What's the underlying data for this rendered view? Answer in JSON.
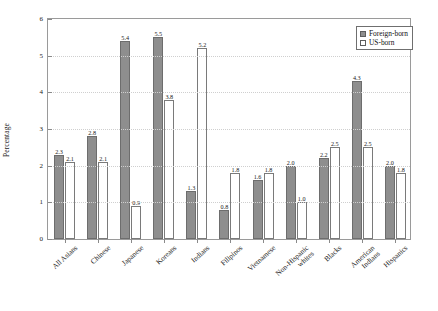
{
  "chart_data": {
    "type": "bar",
    "title": "",
    "xlabel": "",
    "ylabel": "Percentage",
    "ylim": [
      0,
      6
    ],
    "yticks": [
      0,
      1,
      2,
      3,
      4,
      5,
      6
    ],
    "grid": true,
    "legend_position": "top-right",
    "categories": [
      "All Asians",
      "Chinese",
      "Japanese",
      "Koreans",
      "Indians",
      "Filipinos",
      "Vietnamese",
      "Non-Hispanic whites",
      "Blacks",
      "American Indians",
      "Hispanics"
    ],
    "category_lines": [
      [
        "All Asians"
      ],
      [
        "Chinese"
      ],
      [
        "Japanese"
      ],
      [
        "Koreans"
      ],
      [
        "Indians"
      ],
      [
        "Filipinos"
      ],
      [
        "Vietnamese"
      ],
      [
        "Non-Hispanic",
        "whites"
      ],
      [
        "Blacks"
      ],
      [
        "American",
        "Indians"
      ],
      [
        "Hispanics"
      ]
    ],
    "series": [
      {
        "name": "Foreign-born",
        "color": "#8e8e8e",
        "values": [
          2.3,
          2.8,
          5.4,
          5.5,
          1.3,
          0.8,
          1.6,
          2.0,
          2.2,
          4.3,
          2.0
        ],
        "labels": [
          "2.3",
          "2.8",
          "5.4",
          "5.5",
          "1.3",
          "0.8",
          "1.6",
          "2.0",
          "2.2",
          "4.3",
          "2.0"
        ]
      },
      {
        "name": "US-born",
        "color": "#ffffff",
        "values": [
          2.1,
          2.1,
          0.9,
          3.8,
          5.2,
          1.8,
          1.8,
          1.0,
          2.5,
          2.5,
          1.8
        ],
        "labels": [
          "2.1",
          "2.1",
          "0.9",
          "3.8",
          "5.2",
          "1.8",
          "1.8",
          "1.0",
          "2.5",
          "2.5",
          "1.8"
        ]
      }
    ]
  },
  "legend": {
    "items": [
      {
        "label": "Foreign-born"
      },
      {
        "label": "US-born"
      }
    ]
  }
}
